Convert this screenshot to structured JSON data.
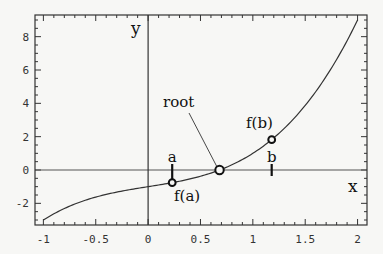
{
  "chart_data": {
    "type": "line",
    "title": "",
    "function": "x^3 + x - 1",
    "xlabel": "x",
    "ylabel": "y",
    "xlim": [
      -1.08,
      2.09
    ],
    "ylim": [
      -3.3,
      9.3
    ],
    "x_ticks": [
      -1,
      -0.5,
      0,
      0.5,
      1,
      1.5,
      2
    ],
    "x_tick_labels": [
      "-1",
      "-0.5",
      "0",
      "0.5",
      "1",
      "1.5",
      "2"
    ],
    "y_ticks": [
      -2,
      0,
      2,
      4,
      6,
      8
    ],
    "y_tick_labels": [
      "-2",
      "0",
      "2",
      "4",
      "6",
      "8"
    ],
    "x_minor_step": 0.1,
    "y_minor_step": 0.5,
    "grid": false,
    "series": [
      {
        "name": "f(x)",
        "x": [
          -1,
          -0.75,
          -0.5,
          -0.25,
          0,
          0.25,
          0.5,
          0.682,
          0.75,
          1,
          1.18,
          1.25,
          1.5,
          1.75,
          2
        ],
        "y": [
          -3,
          -2.17,
          -1.63,
          -1.27,
          -1,
          -0.73,
          -0.38,
          0,
          0.17,
          1,
          1.82,
          2.2,
          3.88,
          6.11,
          9
        ]
      }
    ],
    "points": [
      {
        "name": "f(a)",
        "x": 0.23,
        "y": -0.76
      },
      {
        "name": "root",
        "x": 0.682,
        "y": 0
      },
      {
        "name": "f(b)",
        "x": 1.18,
        "y": 1.82
      }
    ],
    "annotations": [
      {
        "text": "a",
        "x": 0.23,
        "y": 0,
        "note": "tick mark at x=a on x-axis"
      },
      {
        "text": "b",
        "x": 1.18,
        "y": 0,
        "note": "tick mark at x=b on x-axis"
      },
      {
        "text": "f(a)",
        "x": 0.23,
        "y": -0.76
      },
      {
        "text": "f(b)",
        "x": 1.18,
        "y": 1.82
      },
      {
        "text": "root",
        "x": 0.682,
        "y": 0,
        "note": "leader line from label to root"
      }
    ]
  },
  "labels": {
    "x_axis": "x",
    "y_axis": "y",
    "a": "a",
    "b": "b",
    "fa": "f(a)",
    "fb": "f(b)",
    "root": "root"
  }
}
